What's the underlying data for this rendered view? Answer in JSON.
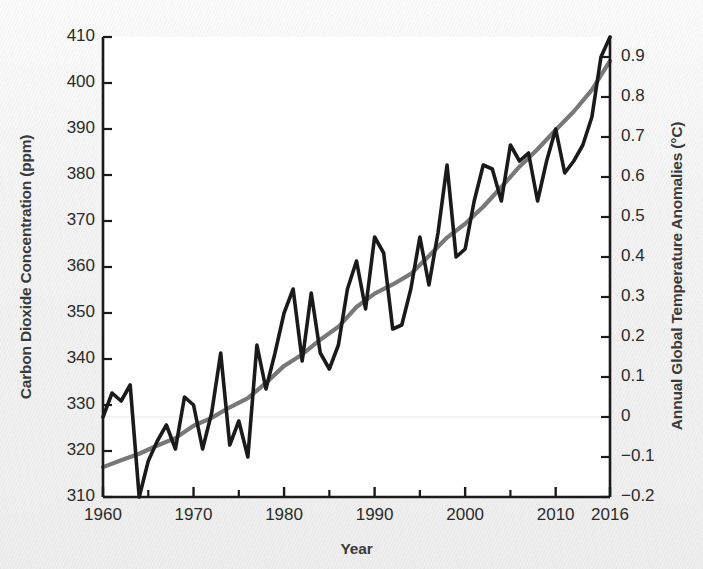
{
  "chart_data": {
    "type": "line",
    "title": "",
    "xlabel": "Year",
    "grid": false,
    "legend_position": "none",
    "xlim": [
      1960,
      2016
    ],
    "xticks_major": [
      1960,
      1970,
      1980,
      1990,
      2000,
      2010,
      2016
    ],
    "xticks_major_labels": [
      "1960",
      "1970",
      "1980",
      "1990",
      "2000",
      "2010",
      "2016"
    ],
    "xticks_minor": [
      1965,
      1975,
      1985,
      1995,
      2005
    ],
    "axis_left": {
      "label": "Carbon Dioxide Concentration (ppm)",
      "lim": [
        310,
        410
      ],
      "ticks": [
        310,
        320,
        330,
        340,
        350,
        360,
        370,
        380,
        390,
        400,
        410
      ],
      "ticklabels": [
        "310",
        "320",
        "330",
        "340",
        "350",
        "360",
        "370",
        "380",
        "390",
        "400",
        "410"
      ]
    },
    "axis_right": {
      "label": "Annual Global Temperature Anomalies (°C)",
      "lim": [
        -0.2,
        0.95
      ],
      "ticks": [
        -0.2,
        -0.1,
        0,
        0.1,
        0.2,
        0.3,
        0.4,
        0.5,
        0.6,
        0.7,
        0.8,
        0.9
      ],
      "ticklabels": [
        "−0.2",
        "−0.1",
        "0",
        "0.1",
        "0.2",
        "0.3",
        "0.4",
        "0.5",
        "0.6",
        "0.7",
        "0.8",
        "0.9"
      ]
    },
    "series": [
      {
        "name": "Carbon Dioxide Concentration",
        "axis": "left",
        "color": "#787878",
        "width": 4.2,
        "x": [
          1960,
          1962,
          1964,
          1966,
          1968,
          1970,
          1972,
          1974,
          1976,
          1978,
          1980,
          1982,
          1984,
          1986,
          1988,
          1990,
          1992,
          1994,
          1996,
          1998,
          2000,
          2002,
          2004,
          2006,
          2008,
          2010,
          2012,
          2014,
          2016
        ],
        "values": [
          316.5,
          318.0,
          319.4,
          321.2,
          322.8,
          325.5,
          327.2,
          329.5,
          331.5,
          334.8,
          338.5,
          341.0,
          344.2,
          347.0,
          351.3,
          354.2,
          356.2,
          358.5,
          362.4,
          366.4,
          369.4,
          373.1,
          377.4,
          381.8,
          385.6,
          389.8,
          393.8,
          398.5,
          404.8
        ],
        "note": "Smooth monotonically increasing Mauna Loa CO2 trend"
      },
      {
        "name": "Annual Global Temperature Anomalies",
        "axis": "right",
        "color": "#1a1a1a",
        "width": 3.6,
        "x": [
          1960,
          1961,
          1962,
          1963,
          1964,
          1965,
          1966,
          1967,
          1968,
          1969,
          1970,
          1971,
          1972,
          1973,
          1974,
          1975,
          1976,
          1977,
          1978,
          1979,
          1980,
          1981,
          1982,
          1983,
          1984,
          1985,
          1986,
          1987,
          1988,
          1989,
          1990,
          1991,
          1992,
          1993,
          1994,
          1995,
          1996,
          1997,
          1998,
          1999,
          2000,
          2001,
          2002,
          2003,
          2004,
          2005,
          2006,
          2007,
          2008,
          2009,
          2010,
          2011,
          2012,
          2013,
          2014,
          2015,
          2016
        ],
        "values": [
          0.0,
          0.06,
          0.04,
          0.08,
          -0.2,
          -0.11,
          -0.06,
          -0.02,
          -0.08,
          0.05,
          0.03,
          -0.08,
          0.01,
          0.16,
          -0.07,
          -0.01,
          -0.1,
          0.18,
          0.07,
          0.16,
          0.26,
          0.32,
          0.14,
          0.31,
          0.16,
          0.12,
          0.18,
          0.32,
          0.39,
          0.27,
          0.45,
          0.41,
          0.22,
          0.23,
          0.32,
          0.45,
          0.33,
          0.46,
          0.63,
          0.4,
          0.42,
          0.54,
          0.63,
          0.62,
          0.54,
          0.68,
          0.64,
          0.66,
          0.54,
          0.64,
          0.72,
          0.61,
          0.64,
          0.68,
          0.75,
          0.9,
          0.95
        ],
        "note": "Jagged year-to-year GISS temperature anomaly series"
      }
    ]
  },
  "zero_reference_line": {
    "value": 0,
    "axis": "right",
    "color": "#f0eef0"
  }
}
